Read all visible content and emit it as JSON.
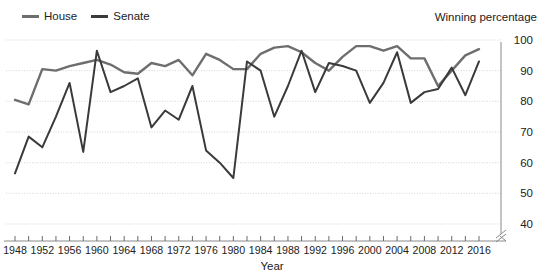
{
  "legend": {
    "position": "top-left",
    "items": [
      {
        "label": "House",
        "color": "#6e6e6e",
        "icon": "line-swatch-icon"
      },
      {
        "label": "Senate",
        "color": "#3a3a3a",
        "icon": "line-swatch-icon"
      }
    ]
  },
  "axis_titles": {
    "y": "Winning percentage",
    "x": "Year"
  },
  "y_ticks": [
    "100",
    "90",
    "80",
    "70",
    "60",
    "50",
    "40"
  ],
  "x_ticks": [
    "1948",
    "1952",
    "1956",
    "1960",
    "1964",
    "1968",
    "1972",
    "1976",
    "1980",
    "1984",
    "1988",
    "1992",
    "1996",
    "2000",
    "2004",
    "2008",
    "2012",
    "2016"
  ],
  "chart_data": {
    "type": "line",
    "title": "",
    "subtitle": "",
    "xlabel": "Year",
    "ylabel": "Winning percentage",
    "xlim": [
      1948,
      2016
    ],
    "ylim": [
      40,
      100
    ],
    "ytick_values": [
      100,
      90,
      80,
      70,
      60,
      50,
      40
    ],
    "xtick_values": [
      1948,
      1952,
      1956,
      1960,
      1964,
      1968,
      1972,
      1976,
      1980,
      1984,
      1988,
      1992,
      1996,
      2000,
      2004,
      2008,
      2012,
      2016
    ],
    "xtick_minor_step": 2,
    "grid": "horizontal-dotted",
    "legend_position": "top-left",
    "x": [
      1948,
      1950,
      1952,
      1954,
      1956,
      1958,
      1960,
      1962,
      1964,
      1966,
      1968,
      1970,
      1972,
      1974,
      1976,
      1978,
      1980,
      1982,
      1984,
      1986,
      1988,
      1990,
      1992,
      1994,
      1996,
      1998,
      2000,
      2002,
      2004,
      2006,
      2008,
      2010,
      2012,
      2014,
      2016
    ],
    "series": [
      {
        "name": "House",
        "color": "#6e6e6e",
        "values": [
          80.5,
          79.0,
          90.5,
          90.0,
          91.5,
          92.5,
          93.5,
          92.0,
          89.5,
          89.0,
          92.5,
          91.5,
          93.5,
          88.5,
          95.5,
          93.5,
          90.5,
          90.5,
          95.5,
          97.5,
          98.0,
          96.0,
          92.5,
          90.0,
          94.5,
          98.0,
          98.0,
          96.5,
          98.0,
          94.0,
          94.0,
          85.0,
          90.0,
          95.0,
          97.0
        ]
      },
      {
        "name": "Senate",
        "color": "#3a3a3a",
        "values": [
          56.5,
          68.5,
          65.0,
          75.0,
          86.0,
          63.5,
          96.5,
          83.0,
          85.0,
          87.5,
          71.5,
          77.0,
          74.0,
          85.0,
          64.0,
          60.0,
          55.0,
          93.0,
          90.0,
          75.0,
          85.0,
          96.5,
          83.0,
          92.5,
          91.5,
          90.0,
          79.5,
          86.0,
          96.0,
          79.5,
          83.0,
          84.0,
          91.0,
          82.0,
          93.0
        ]
      }
    ]
  },
  "geometry": {
    "plot_left": 15,
    "plot_right": 479,
    "y_top_px": 40,
    "y_bottom_px": 224
  }
}
